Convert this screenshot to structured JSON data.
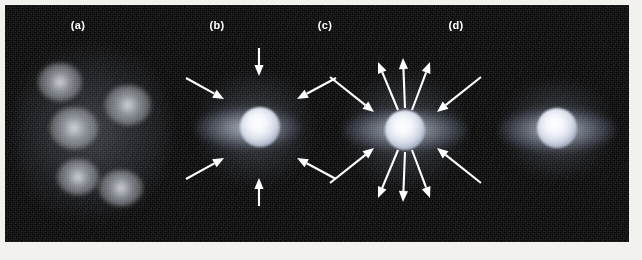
{
  "figure": {
    "background_color": "#f2f1ed",
    "plate_color": "#050505",
    "arrow_color": "#ffffff",
    "glow_color": "#e8ecf5"
  },
  "panels": [
    {
      "id": "a",
      "label": "(a)",
      "label_x": 78,
      "caption_stage": "fragmenting cloud with dense clumps",
      "objects": [
        {
          "name": "clump",
          "cx": 60,
          "cy": 82,
          "rx": 22,
          "ry": 19
        },
        {
          "name": "clump",
          "cx": 128,
          "cy": 105,
          "rx": 23,
          "ry": 20
        },
        {
          "name": "clump",
          "cx": 74,
          "cy": 128,
          "rx": 24,
          "ry": 21
        },
        {
          "name": "clump",
          "cx": 78,
          "cy": 177,
          "rx": 21,
          "ry": 18
        },
        {
          "name": "clump",
          "cx": 121,
          "cy": 188,
          "rx": 22,
          "ry": 18
        }
      ],
      "cloud_halo": {
        "cx": 92,
        "cy": 132,
        "rx": 78,
        "ry": 100
      },
      "arrows": []
    },
    {
      "id": "b",
      "label": "(b)",
      "label_x": 217,
      "caption_stage": "infall onto protostar with flattened disk",
      "core": {
        "cx": 260,
        "cy": 127,
        "r": 20
      },
      "disk": {
        "cx": 248,
        "cy": 128,
        "rx": 52,
        "ry": 21
      },
      "halo": {
        "cx": 255,
        "cy": 128,
        "rx": 62,
        "ry": 58
      },
      "arrows": [
        {
          "name": "infall-arrow-top",
          "x1": 259,
          "y1": 48,
          "x2": 259,
          "y2": 76
        },
        {
          "name": "infall-arrow-bottom",
          "x1": 259,
          "y1": 206,
          "x2": 259,
          "y2": 178
        },
        {
          "name": "infall-arrow-upper-left",
          "x1": 186,
          "y1": 78,
          "x2": 224,
          "y2": 99
        },
        {
          "name": "infall-arrow-upper-right",
          "x1": 336,
          "y1": 78,
          "x2": 297,
          "y2": 99
        },
        {
          "name": "infall-arrow-lower-left",
          "x1": 186,
          "y1": 179,
          "x2": 224,
          "y2": 158
        },
        {
          "name": "infall-arrow-lower-right",
          "x1": 336,
          "y1": 179,
          "x2": 297,
          "y2": 158
        }
      ]
    },
    {
      "id": "c",
      "label": "(c)",
      "label_x": 325,
      "caption_stage": "bipolar outflow while accretion continues",
      "core": {
        "cx": 405,
        "cy": 130,
        "r": 20
      },
      "disk": {
        "cx": 405,
        "cy": 130,
        "rx": 62,
        "ry": 21
      },
      "halo": {
        "cx": 405,
        "cy": 130,
        "rx": 66,
        "ry": 58
      },
      "arrows": [
        {
          "name": "outflow-arrow-up-left",
          "x1": 398,
          "y1": 110,
          "x2": 378,
          "y2": 62
        },
        {
          "name": "outflow-arrow-up-center",
          "x1": 405,
          "y1": 108,
          "x2": 403,
          "y2": 58
        },
        {
          "name": "outflow-arrow-up-right",
          "x1": 412,
          "y1": 110,
          "x2": 430,
          "y2": 62
        },
        {
          "name": "outflow-arrow-down-left",
          "x1": 398,
          "y1": 150,
          "x2": 378,
          "y2": 198
        },
        {
          "name": "outflow-arrow-down-center",
          "x1": 405,
          "y1": 152,
          "x2": 403,
          "y2": 202
        },
        {
          "name": "outflow-arrow-down-right",
          "x1": 412,
          "y1": 150,
          "x2": 430,
          "y2": 198
        },
        {
          "name": "infall-arrow-upper-left",
          "x1": 330,
          "y1": 77,
          "x2": 374,
          "y2": 112
        },
        {
          "name": "infall-arrow-upper-right",
          "x1": 481,
          "y1": 77,
          "x2": 437,
          "y2": 112
        },
        {
          "name": "infall-arrow-lower-left",
          "x1": 330,
          "y1": 183,
          "x2": 374,
          "y2": 148
        },
        {
          "name": "infall-arrow-lower-right",
          "x1": 481,
          "y1": 183,
          "x2": 437,
          "y2": 148
        }
      ]
    },
    {
      "id": "d",
      "label": "(d)",
      "label_x": 456,
      "caption_stage": "young star with residual circumstellar disk",
      "core": {
        "cx": 557,
        "cy": 128,
        "r": 20
      },
      "disk": {
        "cx": 557,
        "cy": 130,
        "rx": 58,
        "ry": 22
      },
      "halo": {
        "cx": 557,
        "cy": 129,
        "rx": 62,
        "ry": 48
      },
      "arrows": []
    }
  ]
}
